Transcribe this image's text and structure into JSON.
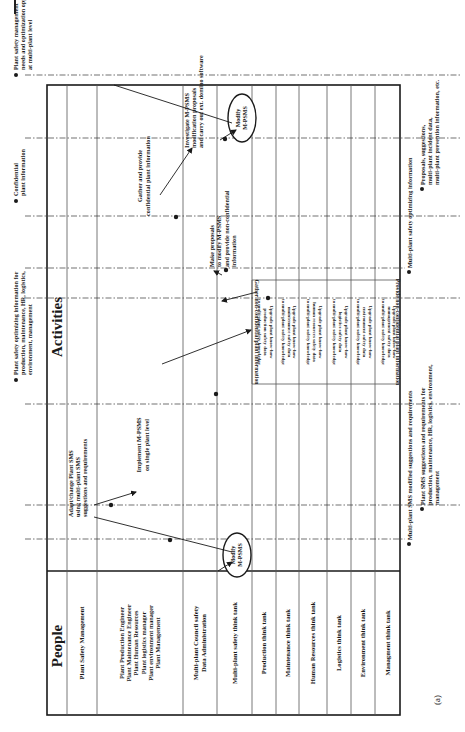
{
  "figure": {
    "label": "(a)",
    "orientation": "rotated-90-ccw",
    "frame": {
      "left": 47,
      "top": 85,
      "right": 400,
      "bottom": 715,
      "divider_y": 571
    },
    "colors": {
      "line": "#1a1a1a",
      "grid": "#555555",
      "dashdot": "#333333",
      "background": "#ffffff"
    }
  },
  "headers": {
    "people": "People",
    "activities": "Activities"
  },
  "lanes": [
    {
      "id": "plant-safety-management",
      "x0": 67,
      "x1": 97,
      "people_lines": [
        "Plant Safety Management"
      ]
    },
    {
      "id": "plant-roles",
      "x0": 97,
      "x1": 183,
      "people_lines": [
        "Plant Production Engineer",
        "Plant Maintenance Engineer",
        "Plant Human Resources",
        "Plant logistics manager",
        "Plant environment manager",
        "Plant Management"
      ]
    },
    {
      "id": "multi-plant-council",
      "x0": 183,
      "x1": 217,
      "people_lines": [
        "Multi-plant Council safety",
        "Data Administration"
      ]
    },
    {
      "id": "multi-plant-safety-think-tank",
      "x0": 217,
      "x1": 252,
      "people_lines": [
        "Multi-plant safety think tank"
      ]
    },
    {
      "id": "production-think-tank",
      "x0": 252,
      "x1": 276,
      "people_lines": [
        "Production think tank"
      ]
    },
    {
      "id": "maintenance-think-tank",
      "x0": 276,
      "x1": 299,
      "people_lines": [
        "Maintenance think tank"
      ]
    },
    {
      "id": "human-resources-think-tank",
      "x0": 299,
      "x1": 327,
      "people_lines": [
        "Human Resources think tank"
      ]
    },
    {
      "id": "logistics-think-tank",
      "x0": 327,
      "x1": 351,
      "people_lines": [
        "Logistics think tank"
      ]
    },
    {
      "id": "environment-think-tank",
      "x0": 351,
      "x1": 375,
      "people_lines": [
        "Environment think tank"
      ]
    },
    {
      "id": "management-think-tank",
      "x0": 375,
      "x1": 400,
      "people_lines": [
        "Managment think tank"
      ]
    }
  ],
  "activities": {
    "adapt_change": [
      "Adapt/change Plant SMS",
      "using multi-plant SMS",
      "suggestions and requirements"
    ],
    "implement": [
      "Implement M-PSMS",
      "on single plant level"
    ],
    "gather_confidential": [
      "Gather and provide",
      "confidential plant information"
    ],
    "investigate": [
      "Investigate M-PSMS",
      "modification proposals",
      "and carry out ext. domino software"
    ],
    "make_proposals": [
      "Make proposals",
      "to modify M-PSMS",
      "and provide non-confidential",
      "information"
    ],
    "modify_bottom": [
      "Modify",
      "M-PSMS"
    ],
    "modify_top": [
      "Modify",
      "M-PSMS"
    ],
    "gather_nonconfidential": "Gather non-confidential plant information",
    "provide_nonconfidential": "Provide non-confidential plant information",
    "upgrades": [
      [
        "Upgrade plant know-how",
        "production safety data",
        "to multi-plant safety knowledge"
      ],
      [
        "Upgrade plant know-how",
        "maintenance safety data",
        "to multi-plant safety knowledge"
      ],
      [
        "Upgrade plant know-how",
        "human resources safety data",
        "to multi-plant safety knowledge"
      ],
      [
        "Upgrade plant know-how",
        "logistics safety data",
        "to multi-plant safety knowledge"
      ],
      [
        "Upgrade plant know-how",
        "environment safety data",
        "to multi-plant safety knowledge"
      ],
      [
        "Upgrade plant know-how",
        "management safety data",
        "to multi-plant safety knowledge"
      ]
    ]
  },
  "inputs_left": [
    {
      "y": 70,
      "lines": [
        "Plant safety management",
        "needs and optimization opportunities",
        "at multi-plant level"
      ]
    },
    {
      "y": 196,
      "lines": [
        "Confidential",
        "plant information"
      ]
    },
    {
      "y": 375,
      "lines": [
        "Plant  safety optimizing information for",
        "production, maintenance, HR, logistics,",
        "environment, management"
      ]
    }
  ],
  "outputs_right": [
    {
      "y": 185,
      "dot_x": 422,
      "lines": [
        "Proposals, suggestions,",
        "multi-plant incident data,",
        "multi-plant prevention information, etc."
      ]
    },
    {
      "y": 268,
      "dot_x": 409,
      "lines": [
        "Multi-plant safety optimizing information"
      ]
    },
    {
      "y": 505,
      "dot_x": 422,
      "lines": [
        "Plant SMS suggestions and requirements  for",
        "production, maintenance, HR, logistics, environment,",
        "management"
      ]
    },
    {
      "y": 540,
      "dot_x": 409,
      "lines": [
        "Multi-plant  SMS modified suggestions and requirements"
      ]
    }
  ]
}
